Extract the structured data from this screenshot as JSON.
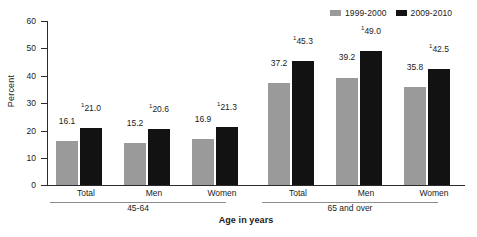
{
  "chart_data": {
    "type": "bar",
    "title": "",
    "xlabel": "Age in years",
    "ylabel": "Percent",
    "ylim": [
      0,
      60
    ],
    "ytick_values": [
      0,
      10,
      20,
      30,
      40,
      50,
      60
    ],
    "ytick_labels": [
      "0",
      "10",
      "20",
      "30",
      "40",
      "50",
      "60"
    ],
    "grid": false,
    "legend_position": "top-right",
    "categories": [
      "Total",
      "Men",
      "Women",
      "Total",
      "Men",
      "Women"
    ],
    "groups": [
      {
        "bracket_label": "45-64",
        "categories": [
          "Total",
          "Men",
          "Women"
        ]
      },
      {
        "bracket_label": "65 and over",
        "categories": [
          "Total",
          "Men",
          "Women"
        ]
      }
    ],
    "series": [
      {
        "name": "1999-2000",
        "color": "#9a9a9a",
        "values": [
          16.1,
          15.2,
          16.9,
          37.2,
          39.2,
          35.8
        ],
        "labels": [
          "16.1",
          "15.2",
          "16.9",
          "37.2",
          "39.2",
          "35.8"
        ],
        "footnote_marker": ""
      },
      {
        "name": "2009-2010",
        "color": "#121212",
        "values": [
          21.0,
          20.6,
          21.3,
          45.3,
          49.0,
          42.5
        ],
        "labels": [
          "21.0",
          "20.6",
          "21.3",
          "45.3",
          "49.0",
          "42.5"
        ],
        "footnote_marker": "1"
      }
    ]
  },
  "legend": {
    "items": [
      {
        "label": "1999-2000",
        "color": "#9a9a9a"
      },
      {
        "label": "2009-2010",
        "color": "#121212"
      }
    ]
  },
  "axis": {
    "y_title": "Percent",
    "x_title": "Age in years"
  }
}
